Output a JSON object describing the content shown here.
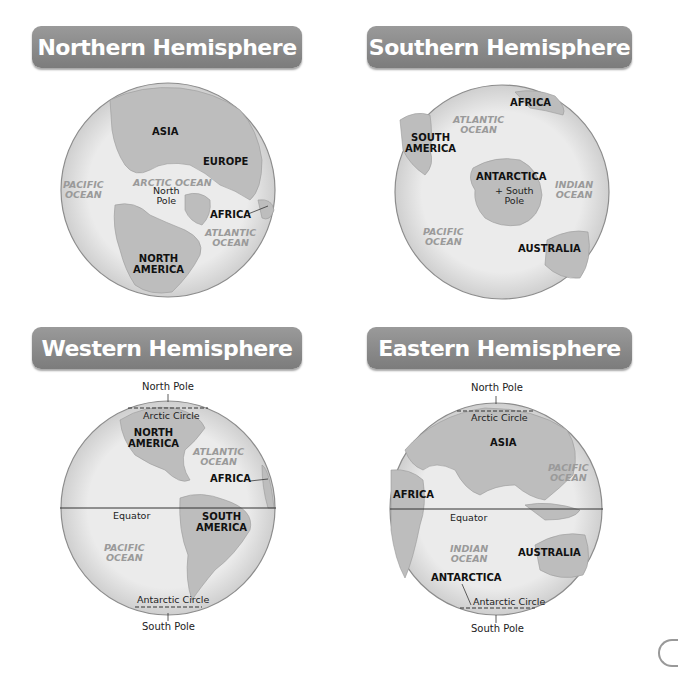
{
  "panels": {
    "northern": {
      "title": "Northern Hemisphere",
      "labels": {
        "asia": "ASIA",
        "europe": "EUROPE",
        "arctic_ocean": "ARCTIC OCEAN",
        "pole_marker": "+",
        "north_pole": "North\nPole",
        "pacific_ocean": "PACIFIC\nOCEAN",
        "africa": "AFRICA",
        "atlantic_ocean": "ATLANTIC\nOCEAN",
        "north_america": "NORTH\nAMERICA"
      }
    },
    "southern": {
      "title": "Southern Hemisphere",
      "labels": {
        "africa": "AFRICA",
        "atlantic_ocean": "ATLANTIC\nOCEAN",
        "south_america": "SOUTH\nAMERICA",
        "antarctica": "ANTARCTICA",
        "south_pole": "+ South\nPole",
        "indian_ocean": "INDIAN\nOCEAN",
        "pacific_ocean": "PACIFIC\nOCEAN",
        "australia": "AUSTRALIA"
      }
    },
    "western": {
      "title": "Western Hemisphere",
      "labels": {
        "north_pole": "North Pole",
        "arctic_circle": "Arctic Circle",
        "north_america": "NORTH\nAMERICA",
        "atlantic_ocean": "ATLANTIC\nOCEAN",
        "africa": "AFRICA",
        "equator": "Equator",
        "south_america": "SOUTH\nAMERICA",
        "pacific_ocean": "PACIFIC\nOCEAN",
        "antarctic_circle": "Antarctic Circle",
        "south_pole": "South Pole"
      }
    },
    "eastern": {
      "title": "Eastern Hemisphere",
      "labels": {
        "north_pole": "North Pole",
        "arctic_circle": "Arctic Circle",
        "asia": "ASIA",
        "pacific_ocean": "PACIFIC\nOCEAN",
        "africa": "AFRICA",
        "equator": "Equator",
        "indian_ocean": "INDIAN\nOCEAN",
        "australia": "AUSTRALIA",
        "antarctica": "ANTARCTICA",
        "antarctic_circle": "Antarctic Circle",
        "south_pole": "South Pole"
      }
    }
  },
  "colors": {
    "banner": "#8a8a8a",
    "banner_text": "#ffffff",
    "ocean": "#e8e8e8",
    "land": "#bdbdbd",
    "globe_border": "#8c8c8c",
    "ocean_label": "#9a9a9a",
    "land_label": "#111111"
  }
}
